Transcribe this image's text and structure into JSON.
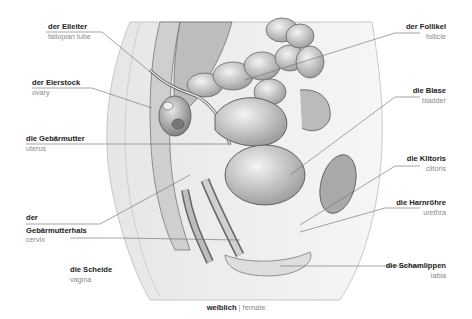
{
  "illustration": {
    "subject": "female pelvis sagittal section",
    "style": "grayscale anatomical engraving"
  },
  "labels_left": [
    {
      "de": "der Eileiter",
      "en": "fallopian tube"
    },
    {
      "de": "der Eierstock",
      "en": "ovary"
    },
    {
      "de": "die Gebärmutter",
      "en": "uterus"
    },
    {
      "de_line1": "der",
      "de_line2": "Gebärmutterhals",
      "en": "cervix"
    },
    {
      "de": "die Scheide",
      "en": "vagina"
    }
  ],
  "labels_right": [
    {
      "de": "der Follikel",
      "en": "follicle"
    },
    {
      "de": "die Blase",
      "en": "bladder"
    },
    {
      "de": "die Klitoris",
      "en": "clitoris"
    },
    {
      "de": "die Harnröhre",
      "en": "urethra"
    },
    {
      "de": "die Schamlippen",
      "en": "labia"
    }
  ],
  "caption": {
    "de": "weiblich",
    "separator": "|",
    "en": "female"
  }
}
